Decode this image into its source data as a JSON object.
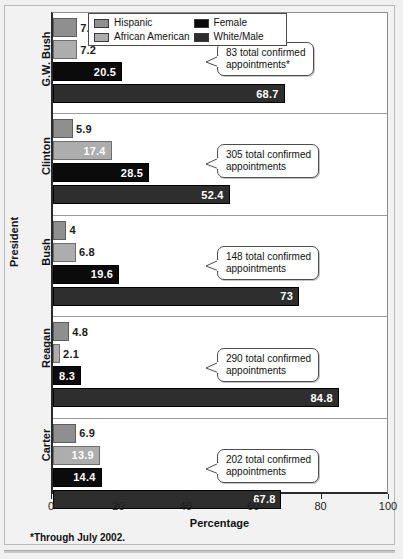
{
  "chart_data": {
    "type": "bar",
    "orientation": "horizontal",
    "title": "",
    "xlabel": "Percentage",
    "ylabel": "President",
    "xlim": [
      0,
      100
    ],
    "xticks": [
      0,
      20,
      40,
      60,
      80,
      100
    ],
    "xtick_labels": [
      "0",
      "20",
      "40",
      "60",
      "80",
      "100"
    ],
    "grid": false,
    "legend_position": "top-center",
    "legend": [
      "Hispanic",
      "African American",
      "Female",
      "White/Male"
    ],
    "series": [
      {
        "name": "Hispanic",
        "color": "#8f8f8f",
        "values": [
          7.2,
          5.9,
          4,
          4.8,
          6.9
        ]
      },
      {
        "name": "African American",
        "color": "#adadad",
        "values": [
          7.2,
          17.4,
          6.8,
          2.1,
          13.9
        ]
      },
      {
        "name": "Female",
        "color": "#0b0b0b",
        "values": [
          20.5,
          28.5,
          19.6,
          8.3,
          14.4
        ]
      },
      {
        "name": "White/Male",
        "color": "#2e2e2e",
        "values": [
          68.7,
          52.4,
          73,
          84.8,
          67.8
        ]
      }
    ],
    "categories": [
      "G.W. Bush",
      "Clinton",
      "Bush",
      "Reagan",
      "Carter"
    ],
    "annotations": [
      "83 total confirmed appointments*",
      "305 total confirmed appointments",
      "148 total confirmed appointments",
      "290 total confirmed appointments",
      "202 total confirmed appointments"
    ],
    "footnote": "*Through July 2002."
  },
  "legend": {
    "items": [
      {
        "label": "Hispanic",
        "color": "#8f8f8f"
      },
      {
        "label": "African American",
        "color": "#adadad"
      },
      {
        "label": "Female",
        "color": "#0b0b0b"
      },
      {
        "label": "White/Male",
        "color": "#2e2e2e"
      }
    ]
  },
  "axes": {
    "x_title": "Percentage",
    "y_title": "President",
    "x_tick_labels": [
      "0",
      "20",
      "40",
      "60",
      "80",
      "100"
    ]
  },
  "groups": [
    {
      "category": "G.W. Bush",
      "callout_line1": "83 total confirmed",
      "callout_line2": "appointments*",
      "bars": [
        {
          "series": "Hispanic",
          "value": 7.2,
          "label": "7.2"
        },
        {
          "series": "African American",
          "value": 7.2,
          "label": "7.2"
        },
        {
          "series": "Female",
          "value": 20.5,
          "label": "20.5"
        },
        {
          "series": "White/Male",
          "value": 68.7,
          "label": "68.7"
        }
      ]
    },
    {
      "category": "Clinton",
      "callout_line1": "305 total confirmed",
      "callout_line2": "appointments",
      "bars": [
        {
          "series": "Hispanic",
          "value": 5.9,
          "label": "5.9"
        },
        {
          "series": "African American",
          "value": 17.4,
          "label": "17.4"
        },
        {
          "series": "Female",
          "value": 28.5,
          "label": "28.5"
        },
        {
          "series": "White/Male",
          "value": 52.4,
          "label": "52.4"
        }
      ]
    },
    {
      "category": "Bush",
      "callout_line1": "148 total confirmed",
      "callout_line2": "appointments",
      "bars": [
        {
          "series": "Hispanic",
          "value": 4,
          "label": "4"
        },
        {
          "series": "African American",
          "value": 6.8,
          "label": "6.8"
        },
        {
          "series": "Female",
          "value": 19.6,
          "label": "19.6"
        },
        {
          "series": "White/Male",
          "value": 73,
          "label": "73"
        }
      ]
    },
    {
      "category": "Reagan",
      "callout_line1": "290 total confirmed",
      "callout_line2": "appointments",
      "bars": [
        {
          "series": "Hispanic",
          "value": 4.8,
          "label": "4.8"
        },
        {
          "series": "African American",
          "value": 2.1,
          "label": "2.1"
        },
        {
          "series": "Female",
          "value": 8.3,
          "label": "8.3"
        },
        {
          "series": "White/Male",
          "value": 84.8,
          "label": "84.8"
        }
      ]
    },
    {
      "category": "Carter",
      "callout_line1": "202 total confirmed",
      "callout_line2": "appointments",
      "bars": [
        {
          "series": "Hispanic",
          "value": 6.9,
          "label": "6.9"
        },
        {
          "series": "African American",
          "value": 13.9,
          "label": "13.9"
        },
        {
          "series": "Female",
          "value": 14.4,
          "label": "14.4"
        },
        {
          "series": "White/Male",
          "value": 67.8,
          "label": "67.8"
        }
      ]
    }
  ],
  "footnote": "*Through July 2002."
}
